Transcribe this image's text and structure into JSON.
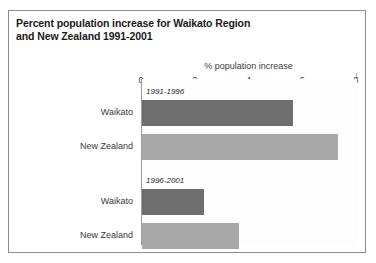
{
  "chart_data": {
    "type": "bar",
    "orientation": "horizontal",
    "title": "Percent population increase for Waikato Region and New Zealand 1991-2001",
    "title_lines": [
      "Percent population increase for Waikato Region",
      "and New Zealand 1991-2001"
    ],
    "xlabel": "% population increase",
    "ylabel": "",
    "xlim": [
      0,
      8
    ],
    "xticks": [
      0,
      2,
      4,
      6,
      8
    ],
    "xtick_labels": [
      "0",
      "2",
      "4",
      "6",
      "8"
    ],
    "grid": false,
    "legend": "none",
    "groups": [
      {
        "label": "1991-1996",
        "categories": [
          "Waikato",
          "New Zealand"
        ],
        "values": [
          5.6,
          7.3
        ]
      },
      {
        "label": "1996-2001",
        "categories": [
          "Waikato",
          "New Zealand"
        ],
        "values": [
          2.3,
          3.6
        ]
      }
    ],
    "bars": [
      {
        "group": "1991-1996",
        "category": "Waikato",
        "value": 5.6,
        "color": "#6e6e6e"
      },
      {
        "group": "1991-1996",
        "category": "New Zealand",
        "value": 7.3,
        "color": "#a8a8a8"
      },
      {
        "group": "1996-2001",
        "category": "Waikato",
        "value": 2.3,
        "color": "#6e6e6e"
      },
      {
        "group": "1996-2001",
        "category": "New Zealand",
        "value": 3.6,
        "color": "#a8a8a8"
      }
    ],
    "colors": {
      "waikato_bar": "#6e6e6e",
      "new_zealand_bar": "#a8a8a8",
      "frame": "#8c8c8c",
      "axis": "#9a9a9a",
      "text": "#1a1a1a"
    }
  }
}
